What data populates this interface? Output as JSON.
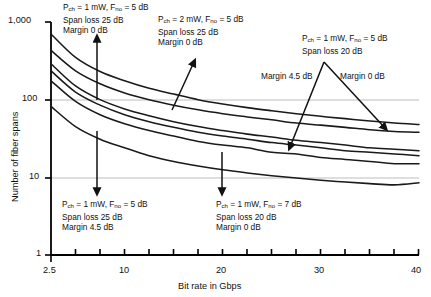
{
  "chart_data": {
    "type": "line",
    "title": "",
    "xlabel": "Bit rate in Gbps",
    "ylabel": "Number of fiber spans",
    "xscale": "linear",
    "yscale": "log",
    "xlim": [
      2.5,
      40
    ],
    "ylim": [
      1,
      1000
    ],
    "grid": "horizontal gridlines at 10 and 100",
    "legend": "none (inline annotations with arrows)",
    "x_ticks": [
      2.5,
      5,
      7.5,
      10,
      12.5,
      15,
      17.5,
      20,
      22.5,
      25,
      27.5,
      30,
      32.5,
      35,
      37.5,
      40
    ],
    "x_tick_labels": [
      "2.5",
      "",
      "",
      "10",
      "",
      "",
      "",
      "20",
      "",
      "",
      "",
      "30",
      "",
      "",
      "",
      "40"
    ],
    "y_ticks": [
      1,
      10,
      100,
      1000
    ],
    "y_tick_labels": [
      "1",
      "10",
      "100",
      "1,000"
    ],
    "x": [
      2.5,
      5,
      7.5,
      10,
      12.5,
      15,
      17.5,
      20,
      22.5,
      25,
      27.5,
      30,
      32.5,
      35,
      37.5,
      40
    ],
    "series": [
      {
        "name": "Pch = 1 mW, Fno = 5 dB, Span loss 20 dB, Margin 0 dB",
        "values": [
          700,
          350,
          230,
          175,
          140,
          118,
          100,
          88,
          79,
          72,
          66,
          61,
          57,
          53,
          50,
          48
        ]
      },
      {
        "name": "Pch = 2 mW, Fno = 5 dB, Span loss 25 dB, Margin 0 dB",
        "values": [
          430,
          235,
          160,
          122,
          100,
          85,
          74,
          66,
          60,
          55,
          50,
          47,
          44,
          41,
          39,
          38
        ]
      },
      {
        "name": "Pch = 1 mW, Fno = 5 dB, Span loss 25 dB, Margin 0 dB",
        "values": [
          290,
          150,
          100,
          76,
          62,
          52,
          45,
          40,
          36,
          33,
          30,
          28,
          26,
          24,
          23,
          22
        ]
      },
      {
        "name": "Pch = 1 mW, Fno = 5 dB, Span loss 20 dB, Margin 4.5 dB",
        "values": [
          235,
          125,
          85,
          64,
          52,
          44,
          38,
          34,
          31,
          28,
          26,
          24,
          22,
          21,
          20,
          19
        ]
      },
      {
        "name": "Pch = 1 mW, Fno = 7 dB, Span loss 20 dB, Margin 0 dB",
        "values": [
          175,
          95,
          64,
          49,
          40,
          34,
          29,
          26,
          24,
          21,
          20,
          18,
          17,
          16,
          15,
          15
        ]
      },
      {
        "name": "Pch = 1 mW, Fno = 5 dB, Span loss 25 dB, Margin 4.5 dB",
        "values": [
          82,
          45,
          31,
          24,
          19,
          16,
          14,
          12.5,
          11.4,
          10.5,
          9.8,
          9.2,
          8.7,
          8.3,
          8.0,
          8.5
        ]
      }
    ],
    "annotations": [
      {
        "id": "a1",
        "lines": [
          "P|ch| = 1 mW, F|no| = 5 dB",
          "Span loss 25 dB",
          "Margin 0 dB"
        ]
      },
      {
        "id": "a2",
        "lines": [
          "P|ch| = 2 mW, F|no| = 5 dB",
          "Span loss 25 dB",
          "Margin 0 dB"
        ]
      },
      {
        "id": "a3",
        "lines": [
          "P|ch| = 1 mW, F|no| = 5 dB",
          "Span loss 20 dB"
        ]
      },
      {
        "id": "a4",
        "lines": [
          "Margin 4.5 dB"
        ]
      },
      {
        "id": "a5",
        "lines": [
          "Margin 0 dB"
        ]
      },
      {
        "id": "a6",
        "lines": [
          "P|ch| = 1 mW, F|no| = 5 dB",
          "Span loss 25 dB",
          "Margin 4.5 dB"
        ]
      },
      {
        "id": "a7",
        "lines": [
          "P|ch| = 1 mW, F|no| = 7 dB",
          "Span loss 20 dB",
          "Margin 0 dB"
        ]
      }
    ]
  },
  "axes": {
    "y_title": "Number of fiber spans",
    "x_title": "Bit rate in Gbps",
    "y_labels": {
      "t1000": "1,000",
      "t100": "100",
      "t10": "10",
      "t1": "1"
    },
    "x_labels": {
      "x25": "2.5",
      "x10": "10",
      "x20": "20",
      "x30": "30",
      "x40": "40"
    }
  },
  "annotations": {
    "top_left": {
      "l1_a": "P",
      "l1_sub": "ch",
      "l1_b": " = 1 mW, F",
      "l1_sub2": "no",
      "l1_c": " = 5 dB",
      "l2": "Span loss 25 dB",
      "l3": "Margin 0 dB"
    },
    "top_mid": {
      "l1_a": "P",
      "l1_sub": "ch",
      "l1_b": " = 2 mW, F",
      "l1_sub2": "no",
      "l1_c": " = 5 dB",
      "l2": "Span loss 25 dB",
      "l3": "Margin 0 dB"
    },
    "top_right": {
      "l1_a": "P",
      "l1_sub": "ch",
      "l1_b": " = 1 mW, F",
      "l1_sub2": "no",
      "l1_c": " = 5 dB",
      "l2": "Span loss 20 dB"
    },
    "margin45": "Margin 4.5 dB",
    "margin0": "Margin 0 dB",
    "bottom_left": {
      "l1_a": "P",
      "l1_sub": "ch",
      "l1_b": " = 1 mW, F",
      "l1_sub2": "no",
      "l1_c": " = 5 dB",
      "l2": "Span loss 25 dB",
      "l3": "Margin 4.5 dB"
    },
    "bottom_mid": {
      "l1_a": "P",
      "l1_sub": "ch",
      "l1_b": " = 1 mW, F",
      "l1_sub2": "no",
      "l1_c": " = 7 dB",
      "l2": "Span loss 20 dB",
      "l3": "Margin 0 dB"
    }
  },
  "colors": {
    "curve": "#1a1a1a",
    "axis": "#000000",
    "grid": "#b9b9b9",
    "text": "#111111",
    "background": "#ffffff"
  }
}
